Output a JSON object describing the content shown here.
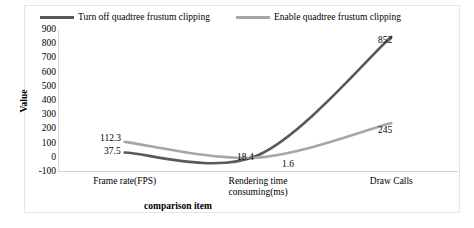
{
  "chart_data": {
    "type": "line",
    "title": "",
    "xlabel": "comparison item",
    "ylabel": "Value",
    "categories": [
      "Frame rate(FPS)",
      "Rendering time consuming(ms)",
      "Draw Calls"
    ],
    "category_lines": [
      [
        "Frame rate(FPS)"
      ],
      [
        "Rendering time",
        "consuming(ms)"
      ],
      [
        "Draw Calls"
      ]
    ],
    "ylim": [
      -100,
      900
    ],
    "yticks": [
      900,
      800,
      700,
      600,
      500,
      400,
      300,
      200,
      100,
      0,
      -100
    ],
    "grid": false,
    "legend_position": "top",
    "series": [
      {
        "name": "Turn off quadtree frustum clipping",
        "color": "#595959",
        "values": [
          37.5,
          18.4,
          852
        ],
        "labels": [
          "37.5",
          "18.4",
          "852"
        ]
      },
      {
        "name": "Enable quadtree frustum clipping",
        "color": "#a6a6a6",
        "values": [
          112.3,
          1.6,
          245
        ],
        "labels": [
          "112.3",
          "1.6",
          "245"
        ]
      }
    ]
  },
  "ytick_labels": {
    "t0": "900",
    "t1": "800",
    "t2": "700",
    "t3": "600",
    "t4": "500",
    "t5": "400",
    "t6": "300",
    "t7": "200",
    "t8": "100",
    "t9": "0",
    "t10": "-100"
  },
  "axis": {
    "y_title": "Value",
    "x_title": "comparison item"
  },
  "xlabels": {
    "c0l0": "Frame rate(FPS)",
    "c1l0": "Rendering time",
    "c1l1": "consuming(ms)",
    "c2l0": "Draw Calls"
  },
  "legend": {
    "s0": "Turn off quadtree frustum clipping",
    "s1": "Enable quadtree frustum clipping"
  },
  "datalabels": {
    "s1c0": "112.3",
    "s0c0": "37.5",
    "s0c1": "18.4",
    "s1c1": "1.6",
    "s0c2": "852",
    "s1c2": "245"
  }
}
